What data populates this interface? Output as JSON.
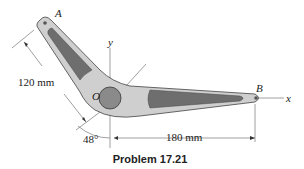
{
  "figure": {
    "caption": "Problem 17.21",
    "points": {
      "A": "A",
      "B": "B",
      "O": "O"
    },
    "axes": {
      "x": "x",
      "y": "y"
    },
    "dimensions": {
      "arm_OA": "120 mm",
      "arm_OB": "180 mm",
      "angle": "48°"
    },
    "colors": {
      "body_light": "#c8c8c8",
      "body_dark": "#6e6e6e",
      "outline": "#555555",
      "line": "#777777"
    }
  }
}
